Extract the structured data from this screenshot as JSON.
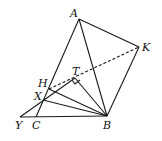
{
  "diagram": {
    "type": "geometry-figure",
    "points": {
      "A": {
        "label": "A",
        "x": 79,
        "y": 19
      },
      "K": {
        "label": "K",
        "x": 139,
        "y": 47
      },
      "B": {
        "label": "B",
        "x": 107,
        "y": 116
      },
      "Y": {
        "label": "Y",
        "x": 20,
        "y": 117
      },
      "C": {
        "label": "C",
        "x": 36,
        "y": 117
      },
      "H": {
        "label": "H",
        "x": 49,
        "y": 89
      },
      "X": {
        "label": "X",
        "x": 43,
        "y": 100
      },
      "T": {
        "label": "T",
        "x": 75,
        "y": 78
      }
    },
    "segments_solid": [
      "AK",
      "KB",
      "AB",
      "AC",
      "YB",
      "YT",
      "TB",
      "HB",
      "XB"
    ],
    "segments_dashed": [
      "TK"
    ],
    "right_angle_at": "T",
    "colors": {
      "stroke": "#1a1a1a",
      "background": "#ffffff"
    }
  }
}
